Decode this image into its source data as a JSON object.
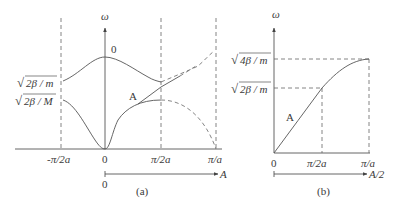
{
  "figure_a": {
    "caption": "(a)",
    "y_axis_label": "ω",
    "x_tick_labels": [
      "-π/2a",
      "0",
      "π/2a",
      "π/a"
    ],
    "y_tick_labels": [
      "√(2β/m)",
      "√(2β/M)"
    ],
    "y_tick_label_parts": {
      "upper": {
        "radical": "√",
        "body": "2β / m"
      },
      "lower": {
        "radical": "√",
        "body": "2β / M"
      }
    },
    "branch_labels": {
      "optical": "0",
      "acoustic": "A"
    },
    "secondary_axis": {
      "origin_label": "0",
      "end_label": "A"
    }
  },
  "figure_b": {
    "caption": "(b)",
    "y_axis_label": "ω",
    "x_tick_labels": [
      "0",
      "π/2a",
      "π/a"
    ],
    "y_tick_label_parts": {
      "upper": {
        "radical": "√",
        "body": "4β / m"
      },
      "lower": {
        "radical": "√",
        "body": "2β / m"
      }
    },
    "branch_label": "A",
    "secondary_axis": {
      "end_label": "A/2"
    }
  },
  "colors": {
    "line": "#555555",
    "text": "#3a3a3a",
    "background": "#ffffff"
  }
}
